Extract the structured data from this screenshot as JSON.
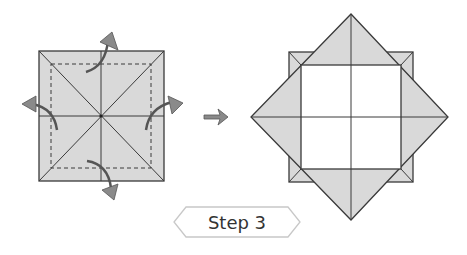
{
  "diagram": {
    "step_label": "Step 3",
    "colors": {
      "paper": "#d9d9d9",
      "line": "#3a3a3a",
      "arrow": "#8a8a8a",
      "label_border": "#c8c8c8",
      "inner": "#ffffff"
    },
    "left_figure": {
      "description": "Square with diagonal and center creases, dashed fold line, four arrows folding corners outward"
    },
    "right_figure": {
      "description": "Result: diamond with flaps folded out, white inner square with center creases"
    }
  }
}
